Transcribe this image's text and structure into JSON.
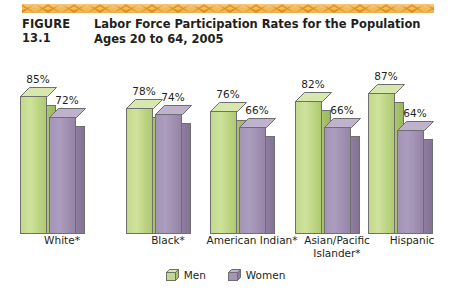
{
  "figure": {
    "number_label": "FIGURE 13.1",
    "title": "Labor Force Participation Rates for the Population Ages 20 to 64, 2005"
  },
  "decor": {
    "zigzag_color_light": "#f5c26b",
    "zigzag_color_dark": "#e08a17"
  },
  "legend": {
    "position": "bottom-center",
    "items": [
      {
        "label": "Men",
        "color": "#c3d98c"
      },
      {
        "label": "Women",
        "color": "#a494b8"
      }
    ]
  },
  "chart_data": {
    "type": "bar",
    "title": "Labor Force Participation Rates for the Population Ages 20 to 64, 2005",
    "xlabel": "",
    "ylabel": "",
    "ylim": [
      0,
      100
    ],
    "grid": false,
    "legend_position": "bottom-center",
    "value_suffix": "%",
    "categories": [
      "White*",
      "Black*",
      "American Indian*",
      "Asian/Pacific\nIslander*",
      "Hispanic"
    ],
    "series": [
      {
        "name": "Men",
        "color": "#c3d98c",
        "values": [
          85,
          78,
          76,
          82,
          87
        ]
      },
      {
        "name": "Women",
        "color": "#a494b8",
        "values": [
          72,
          74,
          66,
          66,
          64
        ]
      }
    ],
    "data_labels": [
      {
        "category": "White*",
        "Men": "85%",
        "Women": "72%"
      },
      {
        "category": "Black*",
        "Men": "78%",
        "Women": "74%"
      },
      {
        "category": "American Indian*",
        "Men": "76%",
        "Women": "66%"
      },
      {
        "category": "Asian/Pacific Islander*",
        "Men": "82%",
        "Women": "66%"
      },
      {
        "category": "Hispanic",
        "Men": "87%",
        "Women": "64%"
      }
    ]
  }
}
